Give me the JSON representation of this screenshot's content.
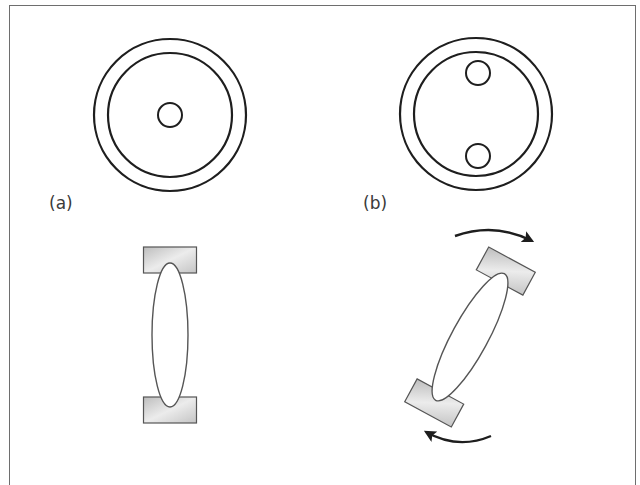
{
  "panels": [
    {
      "label": "(a)",
      "description": "Single central hole; element aligned vertically",
      "top_view": {
        "outer_circle": {
          "cx": 170,
          "cy": 115,
          "r": 76
        },
        "inner_circle": {
          "cx": 170,
          "cy": 115,
          "r": 62
        },
        "holes": [
          {
            "cx": 170,
            "cy": 115,
            "r": 12
          }
        ]
      },
      "side_view": {
        "rotation_deg": 0,
        "center": {
          "x": 170,
          "y": 335
        },
        "ellipse": {
          "rx": 18,
          "ry": 72
        },
        "end_caps": {
          "width": 53,
          "height": 26,
          "offset": 75
        }
      },
      "arrows": []
    },
    {
      "label": "(b)",
      "description": "Two off-center holes; element tilted with rotation arrows",
      "top_view": {
        "outer_circle": {
          "cx": 476,
          "cy": 114,
          "r": 76
        },
        "inner_circle": {
          "cx": 476,
          "cy": 114,
          "r": 62
        },
        "holes": [
          {
            "cx": 478,
            "cy": 73,
            "r": 12
          },
          {
            "cx": 478,
            "cy": 156,
            "r": 12
          }
        ]
      },
      "side_view": {
        "rotation_deg": 28.5,
        "center": {
          "x": 470,
          "y": 337
        },
        "ellipse": {
          "rx": 18,
          "ry": 72
        },
        "end_caps": {
          "width": 53,
          "height": 26,
          "offset": 75
        }
      },
      "arrows": [
        {
          "name": "rotation-arrow-top",
          "direction": "clockwise",
          "path": "M 455 236 Q 495 222 530 240"
        },
        {
          "name": "rotation-arrow-bottom",
          "direction": "clockwise",
          "path": "M 491 436 Q 458 450 428 432"
        }
      ]
    }
  ],
  "colors": {
    "stroke": "#1e1e1e",
    "frame": "#6e6e6e",
    "cap_fill_light": "#e6e6e6",
    "cap_fill_dark": "#bdbdbd",
    "cap_stroke": "#555555",
    "label": "#3a3a3a"
  }
}
